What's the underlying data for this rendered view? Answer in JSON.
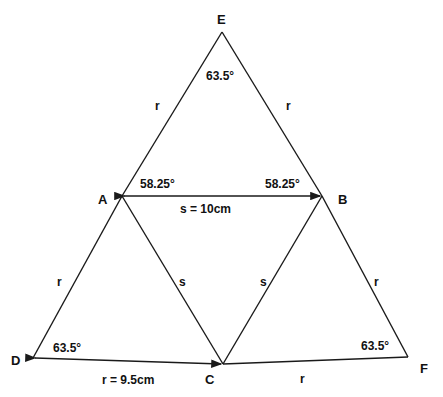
{
  "points": {
    "E": "E",
    "A": "A",
    "B": "B",
    "C": "C",
    "D": "D",
    "F": "F"
  },
  "angles": {
    "E": "63.5°",
    "A": "58.25°",
    "B": "58.25°",
    "D": "63.5°",
    "F": "63.5°"
  },
  "sides": {
    "EA": "r",
    "EB": "r",
    "AD": "r",
    "BF": "r",
    "AC": "s",
    "BC": "s",
    "AB": "s = 10cm",
    "DC": "r = 9.5cm",
    "CF": "r"
  }
}
